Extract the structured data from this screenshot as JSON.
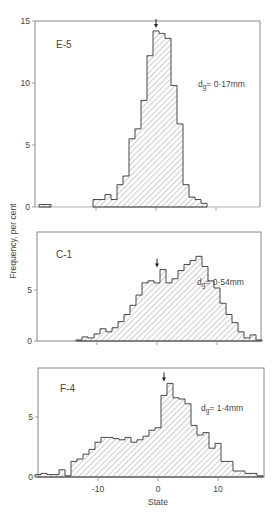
{
  "figure": {
    "ylabel": "Frequency, per cent",
    "xlabel": "State",
    "x_ticks": [
      "-10",
      "0",
      "10"
    ]
  },
  "chart_data": [
    {
      "type": "bar",
      "title": "E-5",
      "annotation": "dg = 0·17mm",
      "annotation_main": "d",
      "annotation_sub": "g",
      "annotation_rest": "= 0·17mm",
      "xlabel": "State",
      "ylabel": "Frequency, per cent",
      "y_ticks": [
        "0",
        "5",
        "10",
        "15"
      ],
      "ylim": [
        0,
        15
      ],
      "xlim": [
        -20.3,
        17.3
      ],
      "marker_arrow_x": 0,
      "bin_width": 1,
      "x": [
        -19,
        -18,
        -10,
        -9,
        -8,
        -7,
        -6,
        -5,
        -4,
        -3,
        -2,
        -1,
        0,
        1,
        2,
        3,
        4,
        5,
        6,
        7,
        8
      ],
      "values": [
        0.2,
        0.2,
        0.6,
        0.6,
        1.0,
        0.6,
        1.8,
        2.5,
        5.5,
        6.3,
        8.6,
        12.2,
        14.2,
        14.0,
        13.6,
        9.8,
        6.7,
        1.8,
        0.8,
        0.6,
        0.3
      ]
    },
    {
      "type": "bar",
      "title": "C-1",
      "annotation_main": "d",
      "annotation_sub": "g",
      "annotation_rest": "= 0·54mm",
      "xlabel": "State",
      "ylabel": "Frequency, per cent",
      "y_ticks": [
        "0",
        "5"
      ],
      "ylim": [
        0,
        10.6
      ],
      "xlim": [
        -20.3,
        17.3
      ],
      "marker_arrow_x": 0,
      "bin_width": 1,
      "x": [
        -13,
        -12,
        -11,
        -10,
        -9,
        -8,
        -7,
        -6,
        -5,
        -4,
        -3,
        -2,
        -1,
        0,
        1,
        2,
        3,
        4,
        5,
        6,
        7,
        8,
        9,
        10,
        11,
        12,
        13,
        14,
        15,
        16,
        17
      ],
      "values": [
        0.1,
        0.4,
        0.3,
        0.7,
        1.2,
        0.9,
        1.3,
        1.9,
        2.6,
        3.5,
        4.5,
        5.7,
        5.9,
        5.7,
        7.0,
        5.7,
        6.1,
        6.9,
        7.5,
        7.9,
        8.3,
        7.3,
        5.9,
        5.2,
        3.7,
        2.6,
        1.8,
        0.9,
        0.3,
        0.6,
        0.1
      ]
    },
    {
      "type": "bar",
      "title": "F-4",
      "annotation_main": "d",
      "annotation_sub": "g",
      "annotation_rest": "= 1·4mm",
      "xlabel": "State",
      "ylabel": "Frequency, per cent",
      "y_ticks": [
        "0",
        "5"
      ],
      "ylim": [
        0,
        9.1
      ],
      "xlim": [
        -20.3,
        17.7
      ],
      "marker_arrow_x": 1,
      "bin_width": 1,
      "x": [
        -20,
        -19,
        -18,
        -17,
        -16,
        -15,
        -14,
        -13,
        -12,
        -11,
        -10,
        -9,
        -8,
        -7,
        -6,
        -5,
        -4,
        -3,
        -2,
        -1,
        0,
        1,
        2,
        3,
        4,
        5,
        6,
        7,
        8,
        9,
        10,
        11,
        12,
        13,
        14,
        15,
        16,
        17
      ],
      "values": [
        0.2,
        0.3,
        0.2,
        0.2,
        0.6,
        0.1,
        1.3,
        1.5,
        1.9,
        2.3,
        2.9,
        3.3,
        3.3,
        3.2,
        3.1,
        3.3,
        2.9,
        3.1,
        3.4,
        3.9,
        4.1,
        6.8,
        7.8,
        6.6,
        6.5,
        6.1,
        4.3,
        3.5,
        3.7,
        2.4,
        2.8,
        1.3,
        1.3,
        0.5,
        0.5,
        0.3,
        0.3,
        0.1
      ]
    }
  ]
}
